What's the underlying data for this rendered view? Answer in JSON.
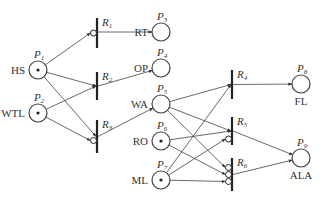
{
  "diagram": {
    "type": "petri-net",
    "colors": {
      "stroke": "#444444",
      "token": "#222222",
      "background": "#ffffff"
    },
    "places": [
      {
        "id": "P1",
        "label": "HS",
        "cx": 38,
        "cy": 70,
        "token": true,
        "label_side": "left"
      },
      {
        "id": "P2",
        "label": "WTL",
        "cx": 38,
        "cy": 113,
        "token": true,
        "label_side": "left"
      },
      {
        "id": "P3",
        "label": "RT",
        "cx": 161,
        "cy": 32,
        "token": false,
        "label_side": "left"
      },
      {
        "id": "P4",
        "label": "OP",
        "cx": 161,
        "cy": 68,
        "token": false,
        "label_side": "left"
      },
      {
        "id": "P5",
        "label": "WA",
        "cx": 161,
        "cy": 104,
        "token": false,
        "label_side": "left"
      },
      {
        "id": "P6",
        "label": "RO",
        "cx": 161,
        "cy": 141,
        "token": true,
        "label_side": "left"
      },
      {
        "id": "P7",
        "label": "ML",
        "cx": 161,
        "cy": 180,
        "token": true,
        "label_side": "left"
      },
      {
        "id": "P8",
        "label": "FL",
        "cx": 301,
        "cy": 84,
        "token": false,
        "label_side": "below"
      },
      {
        "id": "P9",
        "label": "ALA",
        "cx": 301,
        "cy": 158,
        "token": false,
        "label_side": "below"
      }
    ],
    "transitions": [
      {
        "id": "R1",
        "x": 97,
        "y1": 18,
        "y2": 48
      },
      {
        "id": "R2",
        "x": 97,
        "y1": 72,
        "y2": 100
      },
      {
        "id": "R3",
        "x": 97,
        "y1": 120,
        "y2": 153
      },
      {
        "id": "R4",
        "x": 232,
        "y1": 70,
        "y2": 99
      },
      {
        "id": "R5",
        "x": 232,
        "y1": 117,
        "y2": 145
      },
      {
        "id": "R6",
        "x": 232,
        "y1": 158,
        "y2": 191
      }
    ],
    "arcs": [
      {
        "from": "P1",
        "to": "R1",
        "inhibitor": true
      },
      {
        "from": "P1",
        "to": "R2",
        "inhibitor": false
      },
      {
        "from": "P1",
        "to": "R3",
        "inhibitor": false
      },
      {
        "from": "P2",
        "to": "R2",
        "inhibitor": false
      },
      {
        "from": "P2",
        "to": "R3",
        "inhibitor": true
      },
      {
        "from": "R1",
        "to": "P3"
      },
      {
        "from": "R2",
        "to": "P4"
      },
      {
        "from": "R3",
        "to": "P5"
      },
      {
        "from": "P5",
        "to": "R4",
        "inhibitor": false
      },
      {
        "from": "P7",
        "to": "R4",
        "inhibitor": false
      },
      {
        "from": "P5",
        "to": "R5",
        "inhibitor": false
      },
      {
        "from": "P6",
        "to": "R5",
        "inhibitor": false
      },
      {
        "from": "P7",
        "to": "R5",
        "inhibitor": true
      },
      {
        "from": "P5",
        "to": "R6",
        "inhibitor": true
      },
      {
        "from": "P6",
        "to": "R6",
        "inhibitor": true
      },
      {
        "from": "P7",
        "to": "R6",
        "inhibitor": true
      },
      {
        "from": "R4",
        "to": "P8"
      },
      {
        "from": "R5",
        "to": "P9"
      },
      {
        "from": "R6",
        "to": "P9"
      }
    ]
  }
}
